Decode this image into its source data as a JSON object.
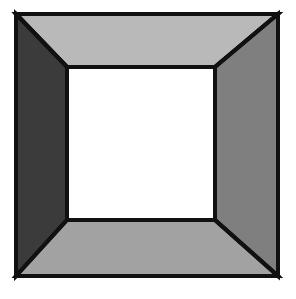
{
  "figure": {
    "name": "beveled-square-frame",
    "background_color": "#ffffff",
    "outline_color": "#111111",
    "outline_width": 4,
    "canvas": {
      "width": 296,
      "height": 299
    },
    "outer_rect": {
      "x": 16,
      "y": 14,
      "width": 262,
      "height": 262
    },
    "inner_rect": {
      "x": 67,
      "y": 67,
      "width": 148,
      "height": 153
    },
    "center_face": {
      "label": "center-opening",
      "color": "#ffffff"
    },
    "faces": [
      {
        "id": "top",
        "label": "top-bevel-face",
        "color": "#b9b9b9",
        "points": "16,14 278,14 215,67 67,67"
      },
      {
        "id": "left",
        "label": "left-bevel-face",
        "color": "#3b3b3b",
        "points": "16,14 67,67 67,220 16,276"
      },
      {
        "id": "right",
        "label": "right-bevel-face",
        "color": "#7f7f7f",
        "points": "278,14 278,276 215,220 215,67"
      },
      {
        "id": "bottom",
        "label": "bottom-bevel-face",
        "color": "#a2a2a2",
        "points": "16,276 67,220 215,220 278,276"
      }
    ],
    "diagonals": [
      {
        "id": "top-left",
        "label": "corner-diagonal-top-left",
        "x1": 16,
        "y1": 14,
        "x2": 67,
        "y2": 67
      },
      {
        "id": "top-right",
        "label": "corner-diagonal-top-right",
        "x1": 278,
        "y1": 14,
        "x2": 215,
        "y2": 67
      },
      {
        "id": "bottom-left",
        "label": "corner-diagonal-bottom-left",
        "x1": 16,
        "y1": 276,
        "x2": 67,
        "y2": 220
      },
      {
        "id": "bottom-right",
        "label": "corner-diagonal-bottom-right",
        "x1": 278,
        "y1": 276,
        "x2": 215,
        "y2": 220
      }
    ]
  }
}
